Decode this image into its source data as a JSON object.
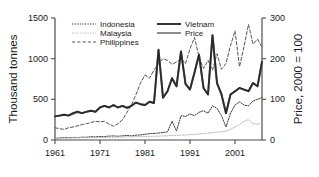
{
  "chart_data": {
    "type": "line",
    "title": "",
    "xlabel": "",
    "ylabel": "Thousand tonnes",
    "y2label": "Price, 2000 = 100",
    "xlim": [
      1961,
      2007
    ],
    "ylim": [
      0,
      1500
    ],
    "y2lim": [
      0,
      300
    ],
    "xticks": [
      1961,
      1971,
      1981,
      1991,
      2001
    ],
    "xticklabels": [
      "1961",
      "1971",
      "1981",
      "1991",
      "2001"
    ],
    "yticks": [
      0,
      500,
      1000,
      1500
    ],
    "yticklabels": [
      "0",
      "500",
      "1000",
      "1500"
    ],
    "y2ticks": [
      0,
      100,
      200,
      300
    ],
    "y2ticklabels": [
      "0",
      "100",
      "200",
      "300"
    ],
    "grid": false,
    "legend_position": "top-center",
    "legend": [
      {
        "name": "Indonesia",
        "style": "dotted",
        "color": "#3a3a3a",
        "axis": "left"
      },
      {
        "name": "Malaysia",
        "style": "dotted",
        "color": "#b9b9b9",
        "axis": "left"
      },
      {
        "name": "Philippines",
        "style": "dashed",
        "color": "#555555",
        "axis": "left"
      },
      {
        "name": "Vietnam",
        "style": "solid",
        "color": "#2b2b2b",
        "axis": "left"
      },
      {
        "name": "Price",
        "style": "solid",
        "color": "#8a8a8a",
        "axis": "right"
      }
    ],
    "x": [
      1961,
      1962,
      1963,
      1964,
      1965,
      1966,
      1967,
      1968,
      1969,
      1970,
      1971,
      1972,
      1973,
      1974,
      1975,
      1976,
      1977,
      1978,
      1979,
      1980,
      1981,
      1982,
      1983,
      1984,
      1985,
      1986,
      1987,
      1988,
      1989,
      1990,
      1991,
      1992,
      1993,
      1994,
      1995,
      1996,
      1997,
      1998,
      1999,
      2000,
      2001,
      2002,
      2003,
      2004,
      2005,
      2006,
      2007
    ],
    "series": [
      {
        "name": "Indonesia",
        "axis": "left",
        "values": [
          12,
          14,
          14,
          16,
          18,
          20,
          22,
          24,
          26,
          28,
          30,
          32,
          34,
          36,
          30,
          34,
          38,
          40,
          42,
          44,
          46,
          50,
          48,
          52,
          56,
          60,
          64,
          70,
          78,
          90,
          150,
          60,
          120,
          210,
          150,
          200,
          230,
          260,
          300,
          360,
          380,
          420,
          430,
          470,
          430,
          450,
          470
        ]
      },
      {
        "name": "Malaysia",
        "axis": "left",
        "values": [
          8,
          9,
          10,
          11,
          12,
          13,
          14,
          15,
          16,
          17,
          18,
          19,
          20,
          22,
          22,
          24,
          26,
          26,
          28,
          28,
          30,
          30,
          32,
          32,
          34,
          34,
          36,
          38,
          40,
          42,
          46,
          50,
          54,
          58,
          60,
          62,
          66,
          70,
          74,
          80,
          100,
          140,
          170,
          200,
          230,
          190,
          200
        ]
      },
      {
        "name": "Philippines",
        "axis": "left",
        "values": [
          18,
          20,
          22,
          24,
          26,
          28,
          30,
          32,
          34,
          36,
          38,
          40,
          42,
          44,
          44,
          46,
          48,
          50,
          52,
          54,
          56,
          58,
          58,
          60,
          62,
          62,
          64,
          66,
          70,
          72,
          74,
          76,
          80,
          82,
          86,
          88,
          90,
          92,
          96,
          100,
          104,
          106,
          110,
          112,
          116,
          118,
          120
        ]
      },
      {
        "name": "Vietnam",
        "axis": "left",
        "values": [
          18,
          20,
          22,
          24,
          26,
          26,
          28,
          28,
          30,
          30,
          32,
          34,
          36,
          38,
          36,
          38,
          40,
          42,
          44,
          46,
          48,
          50,
          52,
          54,
          56,
          56,
          58,
          60,
          62,
          64,
          66,
          70,
          74,
          76,
          80,
          84,
          88,
          92,
          96,
          100,
          104,
          110,
          114,
          118,
          122,
          126,
          130
        ]
      },
      {
        "name": "Price",
        "axis": "right",
        "values": [
          58,
          60,
          62,
          64,
          66,
          70,
          74,
          72,
          76,
          78,
          80,
          86,
          222,
          140,
          116,
          168,
          190,
          176,
          192,
          218,
          148,
          146,
          132,
          164,
          258,
          140,
          100,
          68,
          104,
          128,
          130,
          98,
          150,
          128,
          134,
          130,
          170,
          152,
          168,
          134,
          164,
          146,
          76,
          116,
          150,
          146,
          192
        ]
      }
    ],
    "detail_series": {
      "Vietnam": {
        "note": "thick solid dark line plotted on left axis (thousand tonnes)",
        "peaks": [
          {
            "year": 1974,
            "value": 1110
          },
          {
            "year": 1980,
            "value": 1090
          },
          {
            "year": 1985,
            "value": 1290
          },
          {
            "year": 2007,
            "value": 960
          }
        ]
      },
      "Philippines": {
        "note": "dashed line, rises from ~150 in 1961 to ~1400 peak",
        "peaks": [
          {
            "year": 1997,
            "value": 1340
          },
          {
            "year": 2003,
            "value": 1420
          }
        ]
      }
    }
  }
}
